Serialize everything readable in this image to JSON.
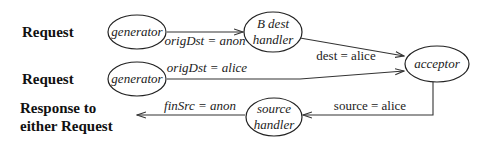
{
  "labels": {
    "request_1": "Request",
    "request_2": "Request",
    "response_line1": "Response to",
    "response_line2": "either Request"
  },
  "nodes": {
    "generator_1": "generator",
    "generator_2": "generator",
    "b_dest_handler_line1": "B dest",
    "b_dest_handler_line2": "handler",
    "acceptor": "acceptor",
    "source_handler_line1": "source",
    "source_handler_line2": "handler"
  },
  "edges": {
    "gen1_to_bdest": "origDst = anon",
    "gen2_to_acceptor": "origDst = alice",
    "bdest_to_acceptor": "dest = alice",
    "acceptor_to_source": "source = alice",
    "source_to_response": "finSrc = anon"
  }
}
